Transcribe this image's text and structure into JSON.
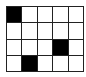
{
  "board": {
    "rows": 4,
    "cols": 5,
    "filled_color": "#000000",
    "empty_color": "#ffffff",
    "cells": [
      [
        1,
        0,
        0,
        0,
        0
      ],
      [
        0,
        0,
        0,
        0,
        0
      ],
      [
        0,
        0,
        0,
        1,
        0
      ],
      [
        0,
        1,
        0,
        0,
        0
      ]
    ]
  }
}
